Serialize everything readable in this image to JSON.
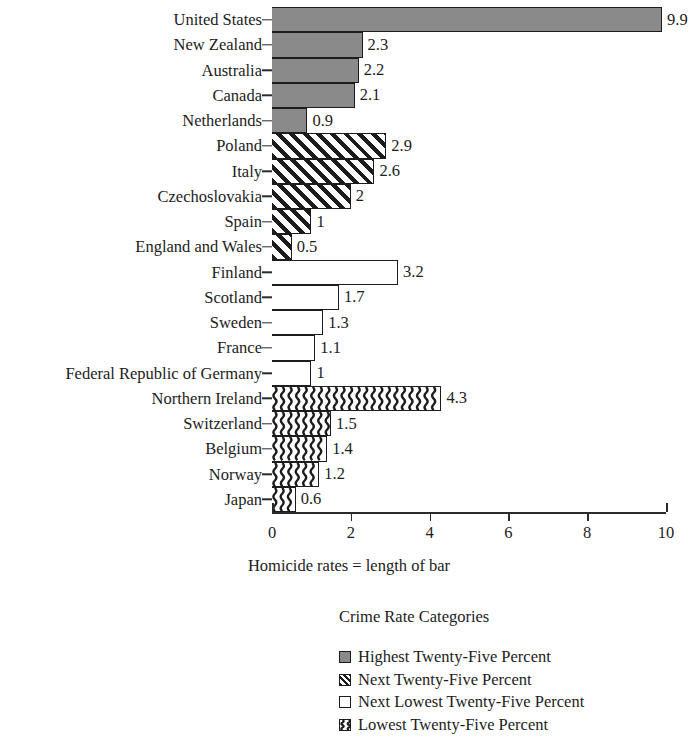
{
  "chart_data": {
    "type": "bar",
    "orientation": "horizontal",
    "title": "",
    "xlabel": "Homicide rates = length of bar",
    "ylabel": "",
    "xlim": [
      0,
      10
    ],
    "xticks": [
      0,
      2,
      4,
      6,
      8,
      10
    ],
    "xtick_labels": [
      "0",
      "2",
      "4",
      "6",
      "8",
      "10"
    ],
    "grid": false,
    "categories": [
      "United States",
      "New Zealand",
      "Australia",
      "Canada",
      "Netherlands",
      "Poland",
      "Italy",
      "Czechoslovakia",
      "Spain",
      "England and Wales",
      "Finland",
      "Scotland",
      "Sweden",
      "France",
      "Federal Republic of Germany",
      "Northern Ireland",
      "Switzerland",
      "Belgium",
      "Norway",
      "Japan"
    ],
    "values": [
      9.9,
      2.3,
      2.2,
      2.1,
      0.9,
      2.9,
      2.6,
      2.0,
      1.0,
      0.5,
      3.2,
      1.7,
      1.3,
      1.1,
      1.0,
      4.3,
      1.5,
      1.4,
      1.2,
      0.6
    ],
    "value_labels": [
      "9.9",
      "2.3",
      "2.2",
      "2.1",
      "0.9",
      "2.9",
      "2.6",
      "2",
      "1",
      "0.5",
      "3.2",
      "1.7",
      "1.3",
      "1.1",
      "1",
      "4.3",
      "1.5",
      "1.4",
      "1.2",
      "0.6"
    ],
    "group_of_bar": [
      "solid",
      "solid",
      "solid",
      "solid",
      "solid",
      "hatch",
      "hatch",
      "hatch",
      "hatch",
      "hatch",
      "white",
      "white",
      "white",
      "white",
      "white",
      "wavy",
      "wavy",
      "wavy",
      "wavy",
      "wavy"
    ],
    "legend_position": "below-center",
    "legend_title": "Crime Rate Categories",
    "legend": [
      {
        "key": "solid",
        "label": "Highest Twenty-Five Percent",
        "color": "#8a8a8a",
        "pattern": "solid-gray"
      },
      {
        "key": "hatch",
        "label": "Next Twenty-Five Percent",
        "color": "#ffffff",
        "pattern": "diagonal-hatch"
      },
      {
        "key": "white",
        "label": "Next Lowest Twenty-Five Percent",
        "color": "#ffffff",
        "pattern": "empty"
      },
      {
        "key": "wavy",
        "label": "Lowest Twenty-Five Percent",
        "color": "#ffffff",
        "pattern": "wavy-vertical"
      }
    ]
  },
  "colors": {
    "ink": "#1c1c1c",
    "gray_fill": "#8a8a8a",
    "background": "#ffffff"
  }
}
